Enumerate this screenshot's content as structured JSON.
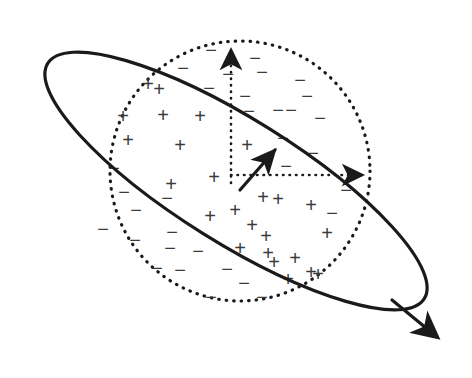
{
  "figure": {
    "background_color": "#ffffff",
    "stroke_color": "#1a1a1a",
    "glyph_color": "#3b3b3b",
    "width": 472,
    "height": 378
  },
  "ellipse": {
    "name": "tilted-ellipse-boundary",
    "center_x": 236,
    "center_y": 181,
    "radius_x": 222,
    "radius_y": 62,
    "rotation_deg": 32,
    "stroke_width": 3.2,
    "style": "solid",
    "arrow_tip_x": 441,
    "arrow_tip_y": 339,
    "arrow_label": "field-direction-arrowhead"
  },
  "circle": {
    "name": "dotted-sphere-outline",
    "center_x": 240,
    "center_y": 171,
    "radius": 130,
    "stroke_width": 3.2,
    "style": "dotted",
    "dash_pattern": "0.5 7"
  },
  "axes": {
    "origin_x": 240,
    "origin_y": 183,
    "style": "dotted",
    "stroke_width": 2.6,
    "dash_pattern": "0.5 6",
    "vertical": {
      "label": "vertical-axis",
      "tip_x": 231,
      "tip_y": 44,
      "from_x": 231,
      "from_y": 183
    },
    "horizontal": {
      "label": "horizontal-axis",
      "tip_x": 369,
      "tip_y": 175,
      "from_x": 231,
      "from_y": 175
    }
  },
  "vector": {
    "name": "resultant-vector-arrow",
    "from_x": 240,
    "from_y": 190,
    "tip_x": 277,
    "tip_y": 147,
    "stroke_width": 3.2,
    "style": "solid"
  },
  "signs": {
    "plus_symbol": "+",
    "minus_symbol": "−",
    "plus_count": 25,
    "minus_count": 33,
    "plus_positions": [
      [
        148,
        84
      ],
      [
        123,
        116
      ],
      [
        163,
        115
      ],
      [
        200,
        116
      ],
      [
        128,
        140
      ],
      [
        180,
        145
      ],
      [
        247,
        145
      ],
      [
        171,
        184
      ],
      [
        214,
        177
      ],
      [
        210,
        216
      ],
      [
        263,
        197
      ],
      [
        278,
        199
      ],
      [
        311,
        205
      ],
      [
        266,
        236
      ],
      [
        327,
        233
      ],
      [
        268,
        253
      ],
      [
        295,
        258
      ],
      [
        240,
        248
      ],
      [
        274,
        262
      ],
      [
        311,
        272
      ],
      [
        288,
        279
      ],
      [
        318,
        274
      ],
      [
        159,
        89
      ],
      [
        235,
        210
      ],
      [
        252,
        225
      ]
    ],
    "minus_positions": [
      [
        211,
        50
      ],
      [
        255,
        58
      ],
      [
        183,
        68
      ],
      [
        262,
        72
      ],
      [
        300,
        80
      ],
      [
        209,
        88
      ],
      [
        245,
        96
      ],
      [
        307,
        96
      ],
      [
        278,
        110
      ],
      [
        249,
        111
      ],
      [
        320,
        118
      ],
      [
        283,
        138
      ],
      [
        114,
        168
      ],
      [
        286,
        166
      ],
      [
        313,
        153
      ],
      [
        124,
        192
      ],
      [
        136,
        210
      ],
      [
        172,
        232
      ],
      [
        346,
        190
      ],
      [
        135,
        240
      ],
      [
        170,
        248
      ],
      [
        198,
        251
      ],
      [
        157,
        268
      ],
      [
        180,
        270
      ],
      [
        227,
        269
      ],
      [
        244,
        283
      ],
      [
        262,
        297
      ],
      [
        211,
        297
      ],
      [
        103,
        229
      ],
      [
        332,
        213
      ],
      [
        291,
        110
      ],
      [
        228,
        74
      ],
      [
        167,
        198
      ]
    ]
  },
  "legend": {
    "plus_region": "inside ellipse band",
    "minus_region": "outside ellipse band within sphere"
  }
}
